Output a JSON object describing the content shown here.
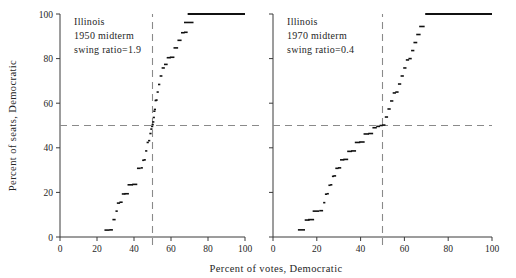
{
  "figure": {
    "width": 516,
    "height": 278,
    "background": "#ffffff",
    "ink_color": "#111111",
    "refline_color": "#8a8a8a",
    "axis_color": "#3a3a3a"
  },
  "shared": {
    "xlabel": "Percent of votes, Democratic",
    "ylabel": "Percent of seats, Democratic",
    "xticks": [
      0,
      20,
      40,
      60,
      80,
      100
    ],
    "yticks": [
      0,
      20,
      40,
      60,
      80,
      100
    ],
    "xlim": [
      0,
      100
    ],
    "ylim": [
      0,
      100
    ],
    "grid": false,
    "hline_at": 50,
    "vline_at": 50
  },
  "chart_data": [
    {
      "type": "scatter",
      "panel": "left",
      "title": "",
      "annotations": [
        "Illinois",
        "1950 midterm",
        "swing ratio=1.9"
      ],
      "state": "Illinois",
      "year_label": "1950 midterm",
      "swing_ratio_label": "swing ratio=1.9",
      "swing_ratio": 1.9,
      "xlabel": "Percent of votes, Democratic",
      "ylabel": "Percent of seats, Democratic",
      "xlim": [
        0,
        100
      ],
      "ylim": [
        0,
        100
      ],
      "xticks": [
        0,
        20,
        40,
        60,
        80,
        100
      ],
      "yticks": [
        0,
        20,
        40,
        60,
        80,
        100
      ],
      "hline_at": 50,
      "vline_at": 50,
      "x": [
        25.4,
        27.6,
        29.2,
        30.6,
        31.6,
        33.0,
        34.4,
        36.0,
        38.0,
        40.4,
        42.6,
        44.2,
        45.0,
        45.8,
        46.6,
        47.4,
        48.2,
        48.9,
        49.4,
        49.8,
        50.1,
        50.4,
        50.7,
        51.0,
        51.3,
        51.7,
        52.2,
        52.8,
        53.6,
        54.6,
        55.8,
        57.2,
        58.8,
        60.6,
        62.6,
        64.6,
        66.4,
        68.0,
        69.6,
        75.0,
        85.0,
        95.0
      ],
      "y": [
        3.1,
        3.2,
        7.8,
        11.6,
        15.2,
        15.6,
        19.3,
        19.4,
        23.4,
        23.6,
        30.8,
        31.0,
        34.4,
        34.6,
        38.6,
        42.4,
        43.2,
        46.4,
        48.4,
        49.6,
        50.4,
        51.6,
        53.6,
        56.4,
        57.2,
        61.2,
        61.4,
        65.0,
        68.4,
        72.2,
        75.8,
        77.4,
        80.4,
        80.6,
        84.8,
        88.2,
        91.6,
        91.8,
        96.2,
        100.0,
        100.0,
        100.0
      ],
      "saturation_line": {
        "y": 100,
        "x_from": 69.0,
        "x_to": 100.0
      },
      "notes": "Seats-votes curve; steep swing ratio near 50% votes."
    },
    {
      "type": "scatter",
      "panel": "right",
      "title": "",
      "annotations": [
        "Illinois",
        "1970 midterm",
        "swing ratio=0.4"
      ],
      "state": "Illinois",
      "year_label": "1970 midterm",
      "swing_ratio_label": "swing ratio=0.4",
      "swing_ratio": 0.4,
      "xlabel": "Percent of votes, Democratic",
      "ylabel": "Percent of seats, Democratic",
      "xlim": [
        0,
        100
      ],
      "ylim": [
        0,
        100
      ],
      "xticks": [
        0,
        20,
        40,
        60,
        80,
        100
      ],
      "yticks": [
        0,
        20,
        40,
        60,
        80,
        100
      ],
      "hline_at": 50,
      "vline_at": 50,
      "x": [
        13.0,
        15.6,
        17.4,
        19.6,
        22.0,
        23.4,
        24.2,
        25.0,
        25.8,
        26.6,
        27.4,
        28.2,
        29.2,
        30.4,
        31.6,
        33.2,
        35.0,
        36.8,
        38.6,
        40.6,
        42.6,
        44.6,
        46.4,
        48.0,
        49.4,
        50.6,
        51.8,
        53.0,
        54.2,
        55.4,
        56.6,
        57.8,
        59.0,
        60.2,
        61.4,
        62.6,
        63.8,
        65.0,
        66.4,
        68.0,
        70.0,
        78.0,
        88.0,
        97.0
      ],
      "y": [
        3.2,
        7.6,
        7.8,
        11.6,
        11.8,
        15.4,
        19.2,
        19.4,
        23.2,
        23.4,
        27.2,
        27.4,
        30.8,
        31.0,
        34.6,
        34.8,
        38.4,
        38.6,
        42.4,
        42.6,
        46.2,
        46.4,
        49.0,
        49.6,
        50.0,
        50.2,
        53.8,
        57.4,
        61.0,
        64.6,
        65.0,
        68.6,
        72.2,
        75.8,
        79.4,
        80.0,
        83.6,
        87.2,
        90.8,
        94.4,
        100.0,
        100.0,
        100.0,
        100.0
      ],
      "saturation_line": {
        "y": 100,
        "x_from": 69.5,
        "x_to": 100.0
      },
      "notes": "Seats-votes curve; shallow swing ratio, long flat crossing at 50% seats."
    }
  ]
}
